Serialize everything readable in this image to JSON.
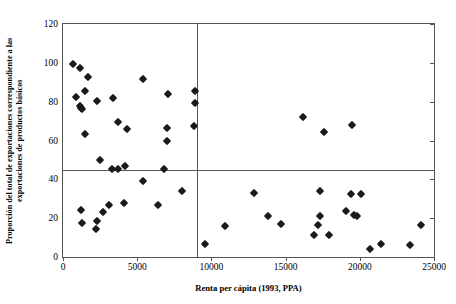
{
  "chart_data": {
    "type": "scatter",
    "title": "",
    "xlabel": "Renta per cápita (1993, PPA)",
    "ylabel": "Proporción del total de exportaciones correspondiente a las exportaciones de productos básicos",
    "xlim": [
      0,
      25000
    ],
    "ylim": [
      0,
      120
    ],
    "xticks": [
      0,
      5000,
      10000,
      15000,
      20000,
      25000
    ],
    "xticklabels": [
      "0",
      "5000",
      "10000",
      "15000",
      "20000",
      "25000"
    ],
    "yticks": [
      0,
      20,
      40,
      60,
      80,
      100,
      120
    ],
    "yticklabels": [
      "0",
      "20",
      "40",
      "60",
      "80",
      "100",
      "120"
    ],
    "grid": false,
    "legend": null,
    "marker": "diamond",
    "marker_color": "#1a1a1a",
    "reference_lines": [
      {
        "orientation": "vertical",
        "value": 9000
      },
      {
        "orientation": "horizontal",
        "value": 45
      }
    ],
    "points": [
      [
        700,
        99.5
      ],
      [
        1150,
        97.5
      ],
      [
        1700,
        92.5
      ],
      [
        1500,
        85.5
      ],
      [
        900,
        82.5
      ],
      [
        2300,
        80.5
      ],
      [
        1150,
        78.0
      ],
      [
        1200,
        76.5
      ],
      [
        1300,
        76.0
      ],
      [
        3400,
        82.0
      ],
      [
        5400,
        91.5
      ],
      [
        7100,
        84.0
      ],
      [
        8900,
        85.5
      ],
      [
        8900,
        79.5
      ],
      [
        1500,
        63.5
      ],
      [
        3700,
        69.5
      ],
      [
        4300,
        66.0
      ],
      [
        7000,
        66.5
      ],
      [
        8800,
        67.5
      ],
      [
        7000,
        59.5
      ],
      [
        2500,
        50.0
      ],
      [
        3300,
        45.5
      ],
      [
        3700,
        45.5
      ],
      [
        4200,
        47.0
      ],
      [
        6800,
        45.5
      ],
      [
        5400,
        39.0
      ],
      [
        8000,
        34.0
      ],
      [
        1200,
        24.0
      ],
      [
        3100,
        27.0
      ],
      [
        4100,
        28.0
      ],
      [
        6400,
        27.0
      ],
      [
        2700,
        23.0
      ],
      [
        1250,
        17.5
      ],
      [
        2300,
        18.5
      ],
      [
        2250,
        14.5
      ],
      [
        16200,
        72.0
      ],
      [
        17600,
        64.5
      ],
      [
        19500,
        68.0
      ],
      [
        9600,
        6.5
      ],
      [
        10900,
        16.0
      ],
      [
        12900,
        33.0
      ],
      [
        13800,
        21.0
      ],
      [
        14700,
        17.0
      ],
      [
        17300,
        34.0
      ],
      [
        17300,
        21.0
      ],
      [
        17200,
        16.5
      ],
      [
        16900,
        11.5
      ],
      [
        17900,
        11.5
      ],
      [
        19100,
        23.5
      ],
      [
        19600,
        21.5
      ],
      [
        19800,
        21.0
      ],
      [
        19400,
        32.5
      ],
      [
        20100,
        32.5
      ],
      [
        20700,
        4.0
      ],
      [
        21400,
        6.5
      ],
      [
        23400,
        6.0
      ],
      [
        24100,
        16.5
      ]
    ]
  }
}
